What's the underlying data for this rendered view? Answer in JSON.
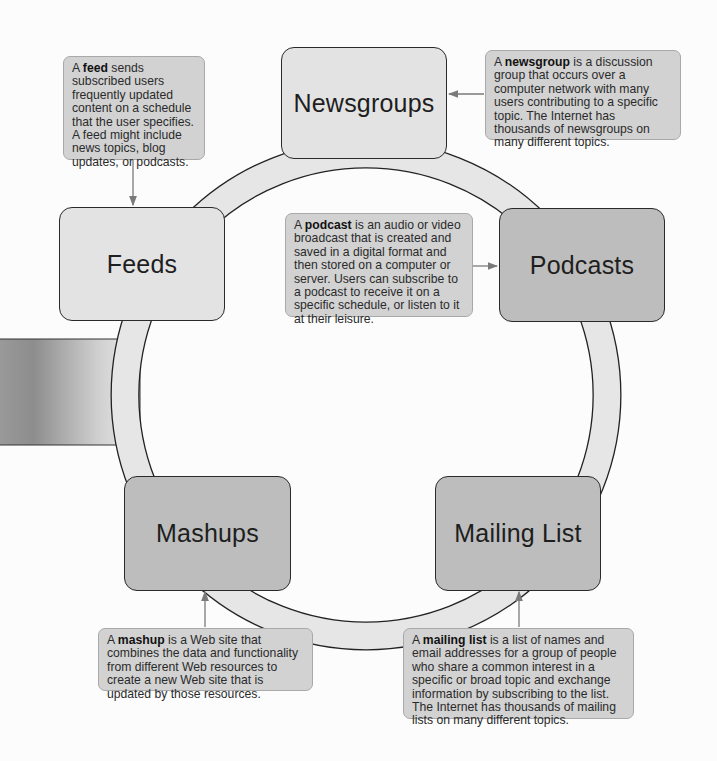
{
  "diagram": {
    "type": "cycle",
    "nodes": [
      {
        "id": "newsgroups",
        "label": "Newsgroups",
        "shade": "light"
      },
      {
        "id": "podcasts",
        "label": "Podcasts",
        "shade": "dark"
      },
      {
        "id": "mailing_list",
        "label": "Mailing List",
        "shade": "dark"
      },
      {
        "id": "mashups",
        "label": "Mashups",
        "shade": "dark"
      },
      {
        "id": "feeds",
        "label": "Feeds",
        "shade": "light"
      }
    ],
    "callouts": {
      "feed": {
        "prefix": "A ",
        "term": "feed",
        "text": " sends subscribed users frequently updated content on a schedule that the user specifies. A feed might include news topics, blog updates, or podcasts.",
        "points_to": "Feeds"
      },
      "newsgroup": {
        "prefix": "A ",
        "term": "newsgroup",
        "text": " is a discussion group that occurs over a computer network with many users contributing to a specific topic. The Internet has thousands of newsgroups on many different topics.",
        "points_to": "Newsgroups"
      },
      "podcast": {
        "prefix": "A ",
        "term": "podcast",
        "text": " is an audio or video broadcast that is created and saved in a digital format and then stored on a computer or server. Users can subscribe to a podcast to receive it on a specific schedule, or listen to it at their leisure.",
        "points_to": "Podcasts"
      },
      "mashup": {
        "prefix": "A ",
        "term": "mashup",
        "text": " is a Web site that combines the data and functionality from different Web resources to create a new Web site that is updated by those resources.",
        "points_to": "Mashups"
      },
      "mailing_list": {
        "prefix": "A ",
        "term": "mailing list",
        "text": " is a list of names and email addresses for a group of people who share a common interest in a specific or broad topic and exchange information by subscribing to the list. The Internet has thousands of mailing lists on many different topics.",
        "points_to": "Mailing List"
      }
    },
    "colors": {
      "node_light": "#e3e3e3",
      "node_dark": "#bdbdbd",
      "ring_fill": "#e6e6e6",
      "callout_fill": "#d2d2d2",
      "arrow": "#7a7a7a"
    }
  }
}
